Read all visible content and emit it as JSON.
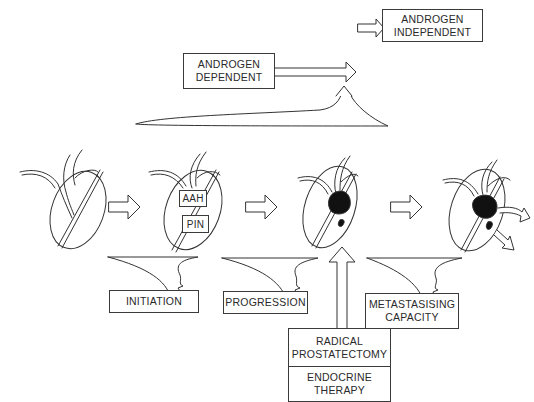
{
  "diagram": {
    "top": {
      "androgen_independent": [
        "ANDROGEN",
        "INDEPENDENT"
      ],
      "androgen_dependent": [
        "ANDROGEN",
        "DEPENDENT"
      ]
    },
    "stages": [
      {
        "name": "normal-prostate",
        "labels": []
      },
      {
        "name": "premalignant-prostate",
        "labels": [
          "AAH",
          "PIN"
        ]
      },
      {
        "name": "localized-cancer-prostate",
        "labels": []
      },
      {
        "name": "metastatic-prostate",
        "labels": []
      }
    ],
    "processes": {
      "initiation": "INITIATION",
      "progression": "PROGRESSION",
      "metastasising": [
        "METASTASISING",
        "CAPACITY"
      ]
    },
    "treatments": {
      "radical_prostatectomy": [
        "RADICAL",
        "PROSTATECTOMY"
      ],
      "endocrine_therapy": [
        "ENDOCRINE",
        "THERAPY"
      ]
    }
  }
}
